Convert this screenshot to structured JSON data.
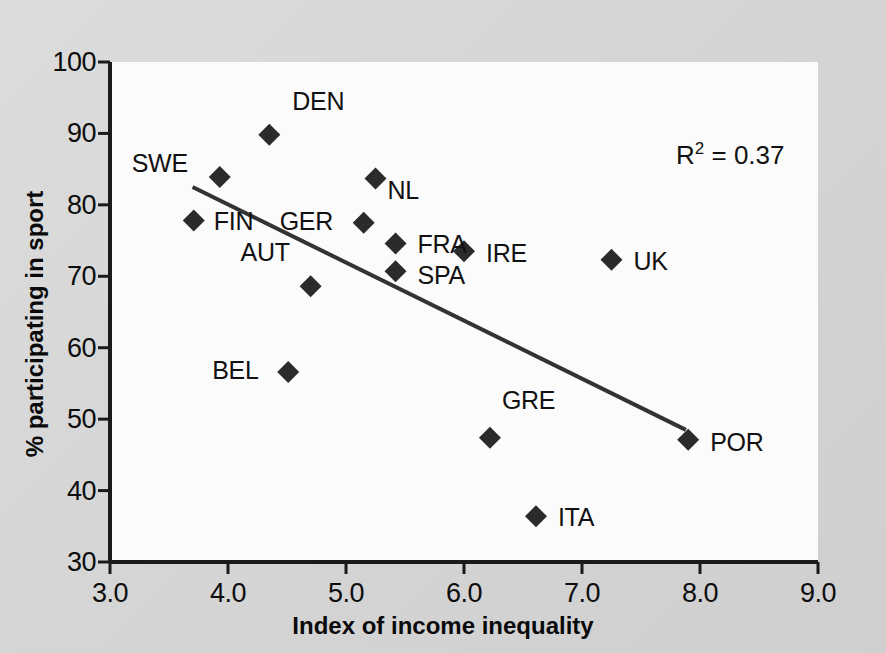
{
  "chart_data": {
    "type": "scatter",
    "title": "",
    "xlabel": "Index of income inequality",
    "ylabel": "% participating in sport",
    "xlim": [
      3.0,
      9.0
    ],
    "ylim": [
      30,
      100
    ],
    "xticks": [
      "3.0",
      "4.0",
      "5.0",
      "6.0",
      "7.0",
      "8.0",
      "9.0"
    ],
    "xtick_values": [
      3.0,
      4.0,
      5.0,
      6.0,
      7.0,
      8.0,
      9.0
    ],
    "yticks": [
      "30",
      "40",
      "50",
      "60",
      "70",
      "80",
      "90",
      "100"
    ],
    "ytick_values": [
      30,
      40,
      50,
      60,
      70,
      80,
      90,
      100
    ],
    "grid": false,
    "legend": "none",
    "annotation": "R² = 0.37",
    "annotation_r_squared": 0.37,
    "marker": "diamond",
    "marker_color": "#2b2b2b",
    "trendline": {
      "label": "linear fit",
      "color": "#333333",
      "x_start": 3.7,
      "y_start": 82.5,
      "x_end": 7.88,
      "y_end": 48.5
    },
    "points": [
      {
        "label": "DEN",
        "x": 4.35,
        "y": 89.8,
        "label_dx": 23,
        "label_dy": -34
      },
      {
        "label": "SWE",
        "x": 3.93,
        "y": 83.9,
        "label_dx": -88,
        "label_dy": -14
      },
      {
        "label": "NL",
        "x": 5.25,
        "y": 83.7,
        "label_dx": 12,
        "label_dy": 12
      },
      {
        "label": "FIN",
        "x": 3.71,
        "y": 77.8,
        "label_dx": 20,
        "label_dy": 0
      },
      {
        "label": "GER",
        "x": 5.15,
        "y": 77.5,
        "label_dx": -84,
        "label_dy": -2
      },
      {
        "label": "FRA",
        "x": 5.42,
        "y": 74.6,
        "label_dx": 22,
        "label_dy": 1
      },
      {
        "label": "IRE",
        "x": 6.0,
        "y": 73.5,
        "label_dx": 22,
        "label_dy": 2
      },
      {
        "label": "UK",
        "x": 7.25,
        "y": 72.3,
        "label_dx": 22,
        "label_dy": 1
      },
      {
        "label": "SPA",
        "x": 5.42,
        "y": 70.7,
        "label_dx": 22,
        "label_dy": 4
      },
      {
        "label": "AUT",
        "x": 4.7,
        "y": 68.6,
        "label_dx": -70,
        "label_dy": -34
      },
      {
        "label": "BEL",
        "x": 4.51,
        "y": 56.6,
        "label_dx": -76,
        "label_dy": -2
      },
      {
        "label": "GRE",
        "x": 6.22,
        "y": 47.4,
        "label_dx": 12,
        "label_dy": -38
      },
      {
        "label": "POR",
        "x": 7.9,
        "y": 47.1,
        "label_dx": 22,
        "label_dy": 2
      },
      {
        "label": "ITA",
        "x": 6.61,
        "y": 36.4,
        "label_dx": 22,
        "label_dy": 1
      }
    ]
  },
  "axes": {
    "x_title": "Index of income inequality",
    "y_title": "% participating in sport"
  },
  "annotation": {
    "r_label": "R",
    "r_exponent": "2",
    "r_value": " = 0.37"
  },
  "colors": {
    "figure_background": "#d8d8d8",
    "panel_background": "#fbfbfb",
    "axis": "#1a1a1a",
    "marker": "#2b2b2b",
    "trendline": "#333333",
    "text": "#111111"
  }
}
